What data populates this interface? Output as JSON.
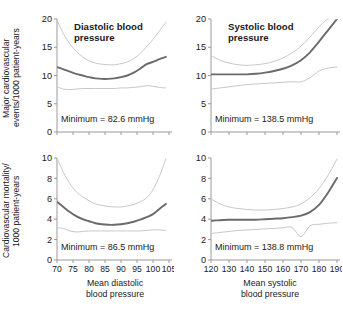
{
  "figure": {
    "background": "#ffffff",
    "line_color_main": "#6b6b6b",
    "line_color_ci": "#c8c8c8",
    "axis_color": "#9a9a9a",
    "text_color": "#1a1a1a"
  },
  "axis_labels": {
    "y_top_line1": "Major cardiovascular",
    "y_top_line2": "events/1000 patient-years",
    "y_bottom_line1": "Cardiovascular mortality/",
    "y_bottom_line2": "1000 patient-years",
    "x_left_line1": "Mean diastolic",
    "x_left_line2": "blood pressure",
    "x_right_line1": "Mean systolic",
    "x_right_line2": "blood pressure"
  },
  "chart_data": [
    {
      "id": "panel-top-left",
      "type": "line",
      "title": "Diastolic blood\npressure",
      "title_line1": "Diastolic blood",
      "title_line2": "pressure",
      "annotation": "Minimum = 82.6 mmHg",
      "minimum_value": 82.6,
      "minimum_units": "mmHg",
      "xlabel": "Mean diastolic blood pressure",
      "ylabel": "Major cardiovascular events/1000 patient-years",
      "xlim": [
        70,
        105
      ],
      "ylim": [
        0,
        20
      ],
      "xticks": [
        70,
        75,
        80,
        85,
        90,
        95,
        100,
        105
      ],
      "yticks": [
        0,
        5,
        10,
        15,
        20
      ],
      "grid": false,
      "legend": "none",
      "x": [
        70,
        72,
        74,
        76,
        78,
        80,
        82,
        84,
        86,
        88,
        90,
        92,
        94,
        96,
        98,
        100,
        102,
        104
      ],
      "series": [
        {
          "name": "Hazard estimate",
          "style": "solid-dark",
          "values": [
            11.5,
            11.1,
            10.7,
            10.3,
            10.0,
            9.7,
            9.5,
            9.4,
            9.4,
            9.5,
            9.7,
            10.0,
            10.5,
            11.2,
            12.0,
            12.4,
            12.9,
            13.3
          ]
        },
        {
          "name": "Upper 95% CI",
          "style": "dashed-light",
          "values": [
            19.8,
            17.4,
            15.6,
            14.3,
            13.3,
            12.6,
            12.2,
            12.0,
            11.9,
            11.9,
            12.1,
            12.4,
            13.0,
            13.9,
            15.1,
            16.4,
            17.9,
            19.4
          ]
        },
        {
          "name": "Lower 95% CI",
          "style": "dashed-light",
          "values": [
            8.0,
            7.6,
            7.5,
            7.6,
            7.7,
            7.7,
            7.7,
            7.7,
            7.7,
            7.7,
            7.8,
            7.8,
            7.9,
            8.0,
            8.2,
            8.1,
            7.9,
            7.8
          ]
        }
      ]
    },
    {
      "id": "panel-top-right",
      "type": "line",
      "title": "Systolic blood\npressure",
      "title_line1": "Systolic blood",
      "title_line2": "pressure",
      "annotation": "Minimum = 138.5 mmHg",
      "minimum_value": 138.5,
      "minimum_units": "mmHg",
      "xlabel": "Mean systolic blood pressure",
      "ylabel": "Major cardiovascular events/1000 patient-years",
      "xlim": [
        120,
        190
      ],
      "ylim": [
        0,
        20
      ],
      "xticks": [
        120,
        130,
        140,
        150,
        160,
        170,
        180,
        190
      ],
      "yticks": [
        0,
        5,
        10,
        15,
        20
      ],
      "grid": false,
      "legend": "none",
      "x": [
        120,
        125,
        130,
        135,
        140,
        145,
        150,
        155,
        160,
        165,
        170,
        175,
        180,
        185,
        190
      ],
      "series": [
        {
          "name": "Hazard estimate",
          "style": "solid-dark",
          "values": [
            10.2,
            10.2,
            10.2,
            10.2,
            10.2,
            10.3,
            10.5,
            10.8,
            11.2,
            11.8,
            12.7,
            14.1,
            16.0,
            18.0,
            20.0
          ]
        },
        {
          "name": "Upper 95% CI",
          "style": "dashed-light",
          "values": [
            13.5,
            12.7,
            12.2,
            11.9,
            11.8,
            11.9,
            12.1,
            12.5,
            13.1,
            14.0,
            15.2,
            16.8,
            18.6,
            20.0,
            20.0
          ]
        },
        {
          "name": "Lower 95% CI",
          "style": "dashed-light",
          "values": [
            7.6,
            7.8,
            8.0,
            8.2,
            8.4,
            8.5,
            8.6,
            8.7,
            8.8,
            8.9,
            8.9,
            9.6,
            10.8,
            11.3,
            11.5
          ]
        }
      ]
    },
    {
      "id": "panel-bottom-left",
      "type": "line",
      "title": "",
      "annotation": "Minimum = 86.5 mmHg",
      "minimum_value": 86.5,
      "minimum_units": "mmHg",
      "xlabel": "Mean diastolic blood pressure",
      "ylabel": "Cardiovascular mortality/1000 patient-years",
      "xlim": [
        70,
        105
      ],
      "ylim": [
        0,
        10
      ],
      "xticks": [
        70,
        75,
        80,
        85,
        90,
        95,
        100,
        105
      ],
      "yticks": [
        0,
        2,
        4,
        6,
        8,
        10
      ],
      "grid": false,
      "legend": "none",
      "x": [
        70,
        72,
        74,
        76,
        78,
        80,
        82,
        84,
        86,
        88,
        90,
        92,
        94,
        96,
        98,
        100,
        102,
        104
      ],
      "series": [
        {
          "name": "Hazard estimate",
          "style": "solid-dark",
          "values": [
            5.7,
            5.2,
            4.7,
            4.3,
            4.0,
            3.8,
            3.6,
            3.5,
            3.45,
            3.45,
            3.5,
            3.6,
            3.75,
            3.95,
            4.2,
            4.5,
            5.0,
            5.5
          ]
        },
        {
          "name": "Upper 95% CI",
          "style": "dashed-light",
          "values": [
            10.0,
            8.6,
            7.5,
            6.7,
            6.2,
            5.8,
            5.5,
            5.35,
            5.25,
            5.2,
            5.2,
            5.3,
            5.45,
            5.7,
            6.1,
            6.9,
            8.2,
            9.9
          ]
        },
        {
          "name": "Lower 95% CI",
          "style": "dashed-light",
          "values": [
            3.15,
            3.1,
            2.85,
            2.75,
            2.8,
            2.85,
            2.85,
            2.85,
            2.85,
            2.85,
            2.85,
            2.85,
            2.85,
            2.85,
            2.9,
            2.95,
            2.95,
            2.9
          ]
        }
      ]
    },
    {
      "id": "panel-bottom-right",
      "type": "line",
      "title": "",
      "annotation": "Minimum = 138.8 mmHg",
      "minimum_value": 138.8,
      "minimum_units": "mmHg",
      "xlabel": "Mean systolic blood pressure",
      "ylabel": "Cardiovascular mortality/1000 patient-years",
      "xlim": [
        120,
        190
      ],
      "ylim": [
        0,
        10
      ],
      "xticks": [
        120,
        130,
        140,
        150,
        160,
        170,
        180,
        190
      ],
      "yticks": [
        0,
        2,
        4,
        6,
        8,
        10
      ],
      "grid": false,
      "legend": "none",
      "x": [
        120,
        125,
        130,
        135,
        140,
        145,
        150,
        155,
        160,
        165,
        170,
        175,
        180,
        185,
        190
      ],
      "series": [
        {
          "name": "Hazard estimate",
          "style": "solid-dark",
          "values": [
            3.85,
            3.9,
            3.95,
            3.95,
            3.95,
            3.95,
            4.0,
            4.05,
            4.1,
            4.2,
            4.35,
            4.7,
            5.4,
            6.6,
            8.05
          ]
        },
        {
          "name": "Upper 95% CI",
          "style": "dashed-light",
          "values": [
            6.0,
            5.5,
            5.2,
            5.05,
            4.95,
            4.9,
            4.9,
            4.95,
            5.05,
            5.2,
            5.5,
            6.1,
            7.0,
            8.3,
            9.9
          ]
        },
        {
          "name": "Lower 95% CI",
          "style": "dashed-light",
          "values": [
            2.6,
            2.7,
            2.8,
            2.9,
            2.95,
            3.0,
            3.05,
            3.1,
            3.15,
            3.2,
            2.3,
            3.35,
            3.5,
            3.6,
            3.65
          ]
        }
      ]
    }
  ]
}
